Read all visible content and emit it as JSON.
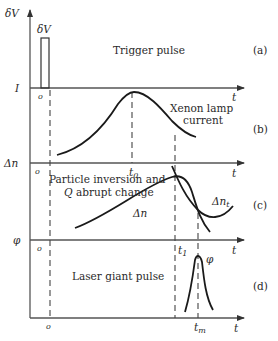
{
  "diagram": {
    "axis_labels": {
      "top_y": "δV",
      "current": "I",
      "inversion": "Δn",
      "photon": "φ",
      "time": "t",
      "origin": "o"
    },
    "panels": [
      {
        "id": "a",
        "tag": "(a)",
        "title": "Trigger pulse",
        "pulse_label": "δV"
      },
      {
        "id": "b",
        "tag": "(b)",
        "title_line1": "Xenon lamp",
        "title_line2": "current"
      },
      {
        "id": "c",
        "tag": "(c)",
        "title_line1": "Particle inversion and",
        "title_line2_var": "Q",
        "title_line2_rest": " abrupt change",
        "curve_label": "Δn",
        "threshold_label": "Δn",
        "threshold_sub": "t"
      },
      {
        "id": "d",
        "tag": "(d)",
        "title": "Laser giant pulse",
        "curve_label": "φ"
      }
    ],
    "time_marks": {
      "t0": "t",
      "t0_sub": "0",
      "t1": "t",
      "t1_sub": "1",
      "tm": "t",
      "tm_sub": "m"
    }
  }
}
